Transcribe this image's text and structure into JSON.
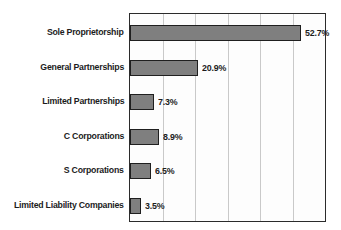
{
  "chart_data": {
    "type": "bar",
    "orientation": "horizontal",
    "title": "",
    "subtitle": "",
    "xlabel": "",
    "ylabel": "",
    "categories": [
      "Sole Proprietorship",
      "General Partnerships",
      "Limited Partnerships",
      "C Corporations",
      "S Corporations",
      "Limited Liability Companies"
    ],
    "values": [
      52.7,
      20.9,
      7.3,
      8.9,
      6.5,
      3.5
    ],
    "value_labels": [
      "52.7%",
      "20.9%",
      "7.3%",
      "8.9%",
      "6.5%",
      "3.5%"
    ],
    "xlim": [
      0,
      60
    ],
    "gridline_values": [
      0,
      10,
      20,
      30,
      40,
      50,
      60
    ],
    "grid": true,
    "legend": false,
    "legend_position": "none",
    "tick_labels_x": [],
    "tick_labels_y": [
      "Sole Proprietorship",
      "General Partnerships",
      "Limited Partnerships",
      "C Corporations",
      "S Corporations",
      "Limited Liability Companies"
    ],
    "annotations": []
  },
  "style": {
    "bar_fill": "#7f7f7f",
    "bar_border": "#1f1f1f",
    "plot_border": "#2b2b2b",
    "plot_background": "#fdfdfd",
    "gridline_color": "#c9c9c9",
    "text_color": "#1c1c1c",
    "page_background": "#ffffff"
  }
}
